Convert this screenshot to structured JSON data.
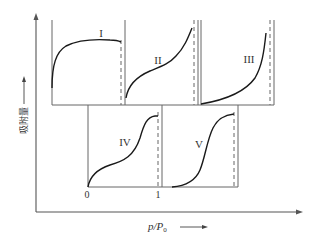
{
  "figure": {
    "y_axis_label": "吸附量",
    "x_axis_label_p": "p",
    "x_axis_label_sep": "/",
    "x_axis_label_p0": "P",
    "x_axis_label_sub": "0",
    "tick_zero": "0",
    "tick_one": "1"
  },
  "panels": [
    {
      "id": "I",
      "label": "I"
    },
    {
      "id": "II",
      "label": "II"
    },
    {
      "id": "III",
      "label": "III"
    },
    {
      "id": "IV",
      "label": "IV"
    },
    {
      "id": "V",
      "label": "V"
    }
  ],
  "colors": {
    "axis": "#555555",
    "curve": "#1a1a1a",
    "text": "#333333"
  }
}
